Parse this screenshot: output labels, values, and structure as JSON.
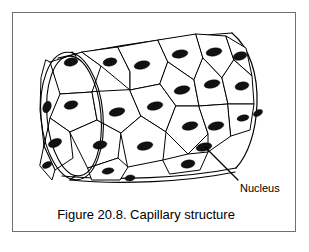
{
  "figure": {
    "caption": "Figure 20.8. Capillary structure",
    "label": "Nucleus",
    "colors": {
      "background": "#ffffff",
      "ink": "#000000",
      "frame": "#6f6f6f",
      "nucleus": "#111111"
    },
    "frame": {
      "x": 12,
      "y": 12,
      "width": 284,
      "height": 220
    },
    "leader_line": {
      "from_x": 238,
      "from_y": 180,
      "to_x": 205,
      "to_y": 147
    },
    "label_position": {
      "x": 240,
      "y": 192
    },
    "caption_position": {
      "x": 146,
      "y": 219
    },
    "cylinder": {
      "near_end_center_x": 72,
      "near_end_center_y": 116,
      "near_end_rx": 27,
      "near_end_ry": 66,
      "far_end_center_x": 233,
      "far_end_center_y": 103,
      "far_end_rx": 24,
      "far_end_ry": 70,
      "wall_thickness": 4
    },
    "cells": [
      {
        "id": "c1",
        "points": "50,62 82,52 101,66 92,92 60,94",
        "nucleus": {
          "cx": 71,
          "cy": 62,
          "rx": 7,
          "ry": 4,
          "rot": -12
        }
      },
      {
        "id": "c2",
        "points": "60,94 92,92 97,120 70,132 50,118",
        "nucleus": {
          "cx": 71,
          "cy": 105,
          "rx": 7,
          "ry": 4,
          "rot": -14
        }
      },
      {
        "id": "c3",
        "points": "50,118 70,132 73,158 55,170 44,146",
        "nucleus": {
          "cx": 55,
          "cy": 143,
          "rx": 7,
          "ry": 4,
          "rot": -22
        }
      },
      {
        "id": "c4",
        "points": "70,132 97,120 121,133 118,158 88,168",
        "nucleus": {
          "cx": 100,
          "cy": 145,
          "rx": 7,
          "ry": 4,
          "rot": -12
        }
      },
      {
        "id": "c5",
        "points": "92,92 97,120 121,133 141,116 130,90",
        "nucleus": {
          "cx": 117,
          "cy": 112,
          "rx": 8,
          "ry": 4,
          "rot": -14
        }
      },
      {
        "id": "c6",
        "points": "82,52 118,47 130,72 130,90 101,66",
        "nucleus": {
          "cx": 110,
          "cy": 62,
          "rx": 7,
          "ry": 4,
          "rot": -10
        }
      },
      {
        "id": "c7",
        "points": "118,47 158,40 168,62 160,84 130,90 130,72",
        "nucleus": {
          "cx": 142,
          "cy": 65,
          "rx": 8,
          "ry": 4,
          "rot": -12
        }
      },
      {
        "id": "c8",
        "points": "130,90 160,84 176,106 166,132 141,116",
        "nucleus": {
          "cx": 155,
          "cy": 106,
          "rx": 8,
          "ry": 4,
          "rot": -12
        }
      },
      {
        "id": "c9",
        "points": "121,133 141,116 166,132 163,160 128,167",
        "nucleus": {
          "cx": 145,
          "cy": 146,
          "rx": 8,
          "ry": 4,
          "rot": -12
        }
      },
      {
        "id": "c10",
        "points": "158,40 196,34 203,58 194,80 168,62",
        "nucleus": {
          "cx": 180,
          "cy": 54,
          "rx": 8,
          "ry": 4,
          "rot": -10
        }
      },
      {
        "id": "c11",
        "points": "168,62 194,80 199,106 176,106 160,84",
        "nucleus": {
          "cx": 182,
          "cy": 90,
          "rx": 8,
          "ry": 4,
          "rot": -12
        }
      },
      {
        "id": "c12",
        "points": "176,106 199,106 208,134 188,154 166,132",
        "nucleus": {
          "cx": 190,
          "cy": 126,
          "rx": 8,
          "ry": 4,
          "rot": -12
        }
      },
      {
        "id": "c13",
        "points": "196,34 226,36 234,60 222,78 203,58",
        "nucleus": {
          "cx": 214,
          "cy": 52,
          "rx": 8,
          "ry": 4,
          "rot": -10
        }
      },
      {
        "id": "c14",
        "points": "203,58 222,78 228,104 199,106 194,80",
        "nucleus": {
          "cx": 212,
          "cy": 84,
          "rx": 8,
          "ry": 4,
          "rot": -12
        }
      },
      {
        "id": "c15",
        "points": "199,106 228,104 231,136 208,152 208,134",
        "nucleus": {
          "cx": 216,
          "cy": 126,
          "rx": 8,
          "ry": 4,
          "rot": -12
        }
      },
      {
        "id": "c16",
        "points": "226,36 246,48 252,76 234,60",
        "nucleus": {
          "cx": 240,
          "cy": 56,
          "rx": 7,
          "ry": 4,
          "rot": -14
        }
      },
      {
        "id": "c17",
        "points": "234,60 252,76 254,104 228,104 222,78",
        "nucleus": {
          "cx": 242,
          "cy": 86,
          "rx": 7,
          "ry": 4,
          "rot": -12
        }
      },
      {
        "id": "c18",
        "points": "228,104 254,104 250,130 231,136",
        "nucleus": {
          "cx": 243,
          "cy": 118,
          "rx": 6,
          "ry": 3,
          "rot": -12
        }
      },
      {
        "id": "c19",
        "points": "163,160 188,154 208,152 200,170 170,174",
        "nucleus": {
          "cx": 188,
          "cy": 164,
          "rx": 7,
          "ry": 4,
          "rot": -10
        }
      },
      {
        "id": "c20",
        "points": "88,168 118,158 128,167 120,180 92,180",
        "nucleus": {
          "cx": 108,
          "cy": 171,
          "rx": 6,
          "ry": 3,
          "rot": -10
        }
      },
      {
        "id": "c21",
        "points": "44,146 55,170 52,180 40,166",
        "nucleus": {
          "cx": 47,
          "cy": 165,
          "rx": 5,
          "ry": 3,
          "rot": -24
        }
      },
      {
        "id": "c22",
        "points": "46,60 50,62 60,94 50,118 44,146 40,110 41,78",
        "nucleus": {
          "cx": 47,
          "cy": 107,
          "rx": 6,
          "ry": 4,
          "rot": -70
        }
      }
    ],
    "extra_nuclei": [
      {
        "cx": 204,
        "cy": 147,
        "rx": 8,
        "ry": 4,
        "rot": -12
      },
      {
        "cx": 258,
        "cy": 113,
        "rx": 5,
        "ry": 3,
        "rot": -30
      },
      {
        "cx": 130,
        "cy": 178,
        "rx": 5,
        "ry": 3,
        "rot": -8
      }
    ]
  }
}
